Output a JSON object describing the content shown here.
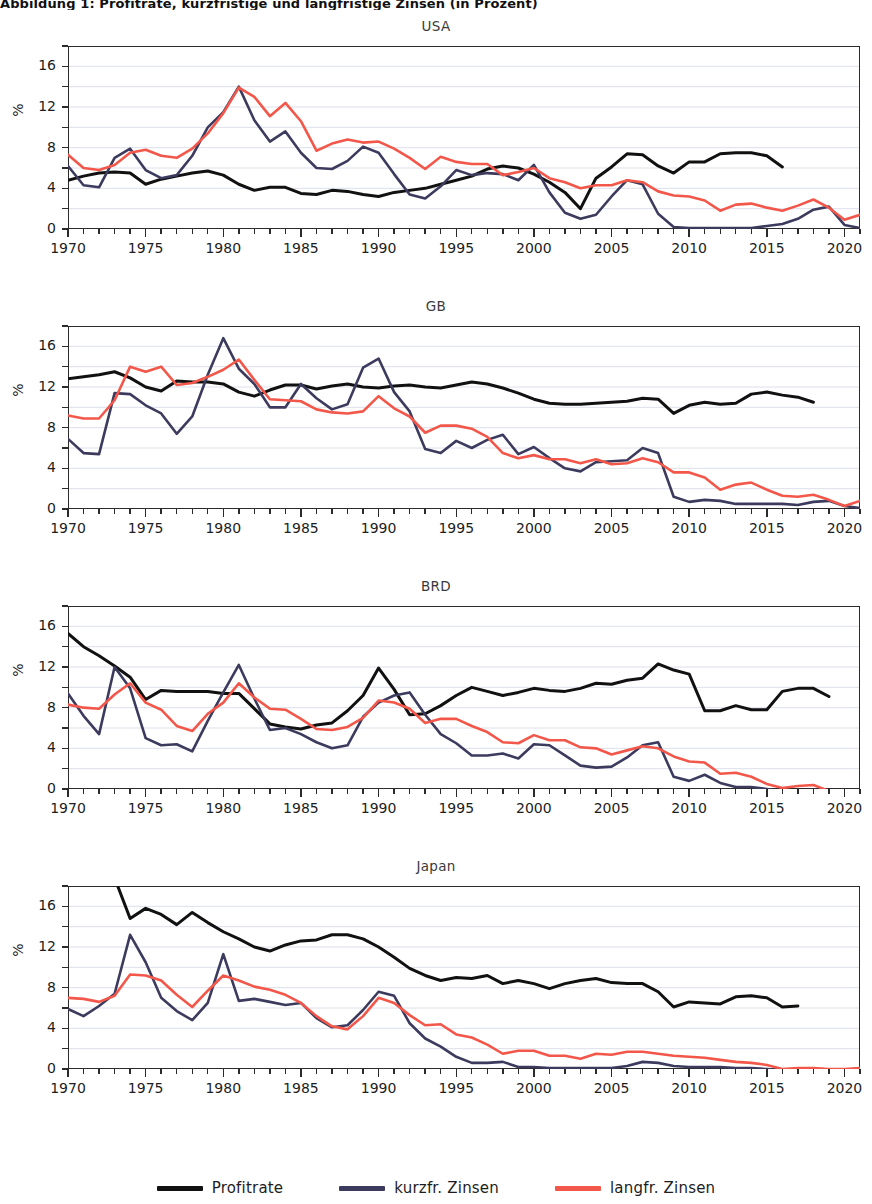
{
  "figure": {
    "top_title": "Abbildung 1: Profitrate, kurzfristige und langfristige Zinsen (in Prozent)",
    "ylabel": "%",
    "y_ticks": [
      "0",
      "4",
      "8",
      "12",
      "16"
    ],
    "x_ticks": [
      "1970",
      "1975",
      "1980",
      "1985",
      "1990",
      "1995",
      "2000",
      "2005",
      "2010",
      "2015",
      "2020"
    ]
  },
  "legend": {
    "position": "bottom",
    "items": [
      {
        "label": "Profitrate",
        "color": "#111111"
      },
      {
        "label": "kurzfr. Zinsen",
        "color": "#3c3b5e"
      },
      {
        "label": "langfr. Zinsen",
        "color": "#f2574a"
      }
    ]
  },
  "colors": {
    "profitrate": "#111111",
    "kurzfr": "#3c3b5e",
    "langfr": "#f2574a",
    "grid": "#d9dde8",
    "axis": "#2b2b2b",
    "background": "#ffffff"
  },
  "chart_data": [
    {
      "type": "line",
      "title": "USA",
      "xlabel": "",
      "ylabel": "%",
      "xlim": [
        1970,
        2021
      ],
      "ylim": [
        0,
        18
      ],
      "grid": true,
      "x": [
        1970,
        1971,
        1972,
        1973,
        1974,
        1975,
        1976,
        1977,
        1978,
        1979,
        1980,
        1981,
        1982,
        1983,
        1984,
        1985,
        1986,
        1987,
        1988,
        1989,
        1990,
        1991,
        1992,
        1993,
        1994,
        1995,
        1996,
        1997,
        1998,
        1999,
        2000,
        2001,
        2002,
        2003,
        2004,
        2005,
        2006,
        2007,
        2008,
        2009,
        2010,
        2011,
        2012,
        2013,
        2014,
        2015,
        2016
      ],
      "series": [
        {
          "name": "Profitrate",
          "color": "#111111",
          "values": [
            4.8,
            5.2,
            5.5,
            5.6,
            5.5,
            4.4,
            4.9,
            5.2,
            5.5,
            5.7,
            5.3,
            4.4,
            3.8,
            4.1,
            4.1,
            3.5,
            3.4,
            3.8,
            3.7,
            3.4,
            3.2,
            3.6,
            3.8,
            4.0,
            4.4,
            4.8,
            5.2,
            5.9,
            6.2,
            6.0,
            5.4,
            4.6,
            3.6,
            2.0,
            5.0,
            6.1,
            7.4,
            7.3,
            6.2,
            5.5,
            6.6,
            6.6,
            7.4,
            7.5,
            7.5,
            7.2,
            6.1
          ]
        },
        {
          "name": "kurzfr. Zinsen",
          "color": "#3c3b5e",
          "values": [
            6.2,
            4.3,
            4.1,
            7.0,
            7.9,
            5.8,
            5.0,
            5.3,
            7.2,
            10.0,
            11.5,
            14.0,
            10.7,
            8.6,
            9.6,
            7.5,
            6.0,
            5.9,
            6.7,
            8.1,
            7.5,
            5.4,
            3.4,
            3.0,
            4.2,
            5.8,
            5.3,
            5.5,
            5.4,
            4.8,
            6.3,
            3.6,
            1.6,
            1.0,
            1.4,
            3.2,
            4.8,
            4.4,
            1.5,
            0.2,
            0.1,
            0.1,
            0.1,
            0.1,
            0.1,
            0.3,
            0.5
          ]
        },
        {
          "name": "langfr. Zinsen",
          "color": "#f2574a",
          "values": [
            7.3,
            6.0,
            5.8,
            6.3,
            7.5,
            7.8,
            7.2,
            7.0,
            7.9,
            9.4,
            11.4,
            13.9,
            13.0,
            11.1,
            12.4,
            10.6,
            7.7,
            8.4,
            8.8,
            8.5,
            8.6,
            7.9,
            7.0,
            5.9,
            7.1,
            6.6,
            6.4,
            6.4,
            5.3,
            5.6,
            6.0,
            5.0,
            4.6,
            4.0,
            4.3,
            4.3,
            4.8,
            4.6,
            3.7,
            3.3,
            3.2,
            2.8,
            1.8,
            2.4,
            2.5,
            2.1,
            1.8
          ]
        }
      ],
      "series_extra": {
        "kurzfr_tail_x": [
          2017,
          2018,
          2019,
          2020,
          2021
        ],
        "kurzfr_tail": [
          1.0,
          1.9,
          2.2,
          0.4,
          0.1
        ],
        "langfr_tail_x": [
          2017,
          2018,
          2019,
          2020,
          2021
        ],
        "langfr_tail": [
          2.3,
          2.9,
          2.1,
          0.9,
          1.4
        ]
      }
    },
    {
      "type": "line",
      "title": "GB",
      "xlabel": "",
      "ylabel": "%",
      "xlim": [
        1970,
        2021
      ],
      "ylim": [
        0,
        18
      ],
      "grid": true,
      "x": [
        1970,
        1971,
        1972,
        1973,
        1974,
        1975,
        1976,
        1977,
        1978,
        1979,
        1980,
        1981,
        1982,
        1983,
        1984,
        1985,
        1986,
        1987,
        1988,
        1989,
        1990,
        1991,
        1992,
        1993,
        1994,
        1995,
        1996,
        1997,
        1998,
        1999,
        2000,
        2001,
        2002,
        2003,
        2004,
        2005,
        2006,
        2007,
        2008,
        2009,
        2010,
        2011,
        2012,
        2013,
        2014,
        2015,
        2016,
        2017,
        2018
      ],
      "series": [
        {
          "name": "Profitrate",
          "color": "#111111",
          "values": [
            12.8,
            13.0,
            13.2,
            13.5,
            12.9,
            12.0,
            11.6,
            12.6,
            12.5,
            12.5,
            12.3,
            11.5,
            11.1,
            11.7,
            12.2,
            12.2,
            11.8,
            12.1,
            12.3,
            12.0,
            11.9,
            12.1,
            12.2,
            12.0,
            11.9,
            12.2,
            12.5,
            12.3,
            11.9,
            11.4,
            10.8,
            10.4,
            10.3,
            10.3,
            10.4,
            10.5,
            10.6,
            10.9,
            10.8,
            9.4,
            10.2,
            10.5,
            10.3,
            10.4,
            11.3,
            11.5,
            11.2,
            11.0,
            10.5
          ]
        },
        {
          "name": "kurzfr. Zinsen",
          "color": "#3c3b5e",
          "values": [
            6.9,
            5.5,
            5.4,
            11.4,
            11.3,
            10.2,
            9.4,
            7.4,
            9.1,
            13.2,
            16.8,
            13.8,
            12.3,
            10.0,
            10.0,
            12.3,
            10.9,
            9.8,
            10.3,
            13.9,
            14.8,
            11.5,
            9.6,
            5.9,
            5.5,
            6.7,
            6.0,
            6.8,
            7.3,
            5.4,
            6.1,
            5.0,
            4.0,
            3.7,
            4.6,
            4.7,
            4.8,
            6.0,
            5.5,
            1.2,
            0.7,
            0.9,
            0.8,
            0.5,
            0.5,
            0.5,
            0.5,
            0.4,
            0.7
          ]
        },
        {
          "name": "langfr. Zinsen",
          "color": "#f2574a",
          "values": [
            9.2,
            8.9,
            8.9,
            10.7,
            14.0,
            13.5,
            14.0,
            12.2,
            12.4,
            13.0,
            13.7,
            14.7,
            12.7,
            10.8,
            10.7,
            10.6,
            9.8,
            9.5,
            9.4,
            9.6,
            11.1,
            9.9,
            9.1,
            7.5,
            8.2,
            8.2,
            7.9,
            7.1,
            5.5,
            5.0,
            5.3,
            4.9,
            4.9,
            4.5,
            4.9,
            4.4,
            4.5,
            5.0,
            4.6,
            3.6,
            3.6,
            3.1,
            1.9,
            2.4,
            2.6,
            1.9,
            1.3,
            1.2,
            1.4
          ]
        }
      ],
      "series_extra": {
        "kurzfr_tail_x": [
          2019,
          2020,
          2021
        ],
        "kurzfr_tail": [
          0.8,
          0.3,
          0.1
        ],
        "langfr_tail_x": [
          2019,
          2020,
          2021
        ],
        "langfr_tail": [
          0.9,
          0.3,
          0.8
        ]
      }
    },
    {
      "type": "line",
      "title": "BRD",
      "xlabel": "",
      "ylabel": "%",
      "xlim": [
        1970,
        2021
      ],
      "ylim": [
        0,
        18
      ],
      "grid": true,
      "x": [
        1970,
        1971,
        1972,
        1973,
        1974,
        1975,
        1976,
        1977,
        1978,
        1979,
        1980,
        1981,
        1982,
        1983,
        1984,
        1985,
        1986,
        1987,
        1988,
        1989,
        1990,
        1991,
        1992,
        1993,
        1994,
        1995,
        1996,
        1997,
        1998,
        1999,
        2000,
        2001,
        2002,
        2003,
        2004,
        2005,
        2006,
        2007,
        2008,
        2009,
        2010,
        2011,
        2012,
        2013,
        2014,
        2015,
        2016,
        2017,
        2018,
        2019
      ],
      "series": [
        {
          "name": "Profitrate",
          "color": "#111111",
          "values": [
            15.3,
            14.0,
            13.1,
            12.1,
            11.0,
            8.8,
            9.7,
            9.6,
            9.6,
            9.6,
            9.4,
            9.4,
            7.9,
            6.4,
            6.1,
            5.9,
            6.3,
            6.5,
            7.7,
            9.2,
            11.9,
            9.8,
            7.3,
            7.4,
            8.2,
            9.2,
            10.0,
            9.6,
            9.2,
            9.5,
            9.9,
            9.7,
            9.6,
            9.9,
            10.4,
            10.3,
            10.7,
            10.9,
            12.3,
            11.7,
            11.3,
            7.7,
            7.7,
            8.2,
            7.8,
            7.8,
            9.6,
            9.9,
            9.9,
            9.1
          ]
        },
        {
          "name": "kurzfr. Zinsen",
          "color": "#3c3b5e",
          "values": [
            9.4,
            7.2,
            5.4,
            12.0,
            9.9,
            5.0,
            4.3,
            4.4,
            3.7,
            6.7,
            9.5,
            12.2,
            8.9,
            5.8,
            6.0,
            5.4,
            4.6,
            4.0,
            4.3,
            7.1,
            8.5,
            9.2,
            9.5,
            7.3,
            5.4,
            4.5,
            3.3,
            3.3,
            3.5,
            3.0,
            4.4,
            4.3,
            3.3,
            2.3,
            2.1,
            2.2,
            3.1,
            4.3,
            4.6,
            1.2,
            0.8,
            1.4,
            0.6,
            0.2,
            0.2,
            0.0,
            -0.3,
            -0.3,
            -0.3,
            -0.4
          ]
        },
        {
          "name": "langfr. Zinsen",
          "color": "#f2574a",
          "values": [
            8.3,
            8.0,
            7.9,
            9.3,
            10.4,
            8.5,
            7.8,
            6.2,
            5.7,
            7.4,
            8.5,
            10.4,
            9.0,
            7.9,
            7.8,
            6.9,
            5.9,
            5.8,
            6.1,
            7.0,
            8.7,
            8.5,
            7.9,
            6.5,
            6.9,
            6.9,
            6.2,
            5.6,
            4.6,
            4.5,
            5.3,
            4.8,
            4.8,
            4.1,
            4.0,
            3.4,
            3.8,
            4.2,
            4.0,
            3.2,
            2.7,
            2.6,
            1.5,
            1.6,
            1.2,
            0.5,
            0.1,
            0.3,
            0.4,
            -0.2
          ]
        }
      ],
      "series_extra": {
        "kurzfr_tail_x": [
          2020,
          2021
        ],
        "kurzfr_tail": [
          -0.4,
          -0.5
        ],
        "langfr_tail_x": [
          2020,
          2021
        ],
        "langfr_tail": [
          -0.5,
          -0.3
        ]
      }
    },
    {
      "type": "line",
      "title": "Japan",
      "xlabel": "",
      "ylabel": "%",
      "xlim": [
        1970,
        2021
      ],
      "ylim": [
        0,
        18
      ],
      "grid": true,
      "x": [
        1970,
        1971,
        1972,
        1973,
        1974,
        1975,
        1976,
        1977,
        1978,
        1979,
        1980,
        1981,
        1982,
        1983,
        1984,
        1985,
        1986,
        1987,
        1988,
        1989,
        1990,
        1991,
        1992,
        1993,
        1994,
        1995,
        1996,
        1997,
        1998,
        1999,
        2000,
        2001,
        2002,
        2003,
        2004,
        2005,
        2006,
        2007,
        2008,
        2009,
        2010,
        2011,
        2012,
        2013,
        2014,
        2015,
        2016,
        2017
      ],
      "series": [
        {
          "name": "Profitrate",
          "color": "#111111",
          "values": [
            21.5,
            20.5,
            19.5,
            18.8,
            14.8,
            15.8,
            15.2,
            14.2,
            15.4,
            14.4,
            13.5,
            12.8,
            12.0,
            11.6,
            12.2,
            12.6,
            12.7,
            13.2,
            13.2,
            12.8,
            12.0,
            11.0,
            9.9,
            9.2,
            8.7,
            9.0,
            8.9,
            9.2,
            8.4,
            8.7,
            8.4,
            7.9,
            8.4,
            8.7,
            8.9,
            8.5,
            8.4,
            8.4,
            7.6,
            6.1,
            6.6,
            6.5,
            6.4,
            7.1,
            7.2,
            7.0,
            6.1,
            6.2
          ]
        },
        {
          "name": "kurzfr. Zinsen",
          "color": "#3c3b5e",
          "values": [
            5.9,
            5.2,
            6.2,
            7.4,
            13.2,
            10.5,
            7.0,
            5.7,
            4.8,
            6.5,
            11.3,
            6.7,
            6.9,
            6.6,
            6.3,
            6.5,
            5.0,
            4.1,
            4.3,
            5.8,
            7.6,
            7.2,
            4.5,
            3.0,
            2.2,
            1.2,
            0.6,
            0.6,
            0.7,
            0.2,
            0.2,
            0.1,
            0.1,
            0.1,
            0.1,
            0.1,
            0.3,
            0.7,
            0.6,
            0.3,
            0.2,
            0.2,
            0.2,
            0.1,
            0.1,
            0.0,
            -0.1,
            -0.1
          ]
        },
        {
          "name": "langfr. Zinsen",
          "color": "#f2574a",
          "values": [
            7.0,
            6.9,
            6.6,
            7.2,
            9.3,
            9.2,
            8.7,
            7.3,
            6.1,
            7.7,
            9.2,
            8.7,
            8.1,
            7.8,
            7.3,
            6.5,
            5.2,
            4.2,
            3.9,
            5.2,
            7.0,
            6.5,
            5.3,
            4.3,
            4.4,
            3.4,
            3.1,
            2.4,
            1.5,
            1.8,
            1.8,
            1.3,
            1.3,
            1.0,
            1.5,
            1.4,
            1.7,
            1.7,
            1.5,
            1.3,
            1.2,
            1.1,
            0.9,
            0.7,
            0.6,
            0.4,
            0.0,
            0.1
          ]
        }
      ],
      "series_extra": {
        "langfr_tail_x": [
          2018,
          2019,
          2020,
          2021
        ],
        "langfr_tail": [
          0.1,
          0.0,
          0.0,
          0.1
        ],
        "kurzfr_tail_x": [
          2018,
          2019,
          2020,
          2021
        ],
        "kurzfr_tail": [
          -0.1,
          -0.1,
          -0.1,
          -0.1
        ]
      }
    }
  ]
}
